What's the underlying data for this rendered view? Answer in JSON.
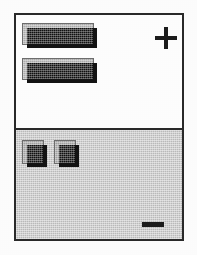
{
  "figure": {
    "kind": "technical-line-drawing",
    "background_color": "#ffffff",
    "frame": {
      "border_color": "#2a2a2a",
      "fill_color": "#ffffff",
      "x": 14,
      "y": 13,
      "width": 170,
      "height": 228
    },
    "regions": [
      {
        "id": "upper",
        "name": "upper-white-region",
        "fill_color": "#fefefe",
        "shading": "none",
        "height": 113
      },
      {
        "id": "lower",
        "name": "lower-shaded-region",
        "fill_color": "#c9c9c9",
        "shading": "dithered-halftone",
        "height": 109
      }
    ],
    "divider": {
      "name": "region-divider-line",
      "color": "#2a2a2a",
      "thickness": 2,
      "y": 113
    },
    "blocks": [
      {
        "id": "bar-top",
        "name": "wide-bar-top",
        "shape": "rectangle",
        "face_color": "#b9b9b9",
        "shadow_color": "#141414",
        "outline_color": "#6d6d6d",
        "region": "upper",
        "x": 6,
        "y": 8,
        "width": 72,
        "height": 22
      },
      {
        "id": "bar-bottom",
        "name": "wide-bar-bottom",
        "shape": "rectangle",
        "face_color": "#b9b9b9",
        "shadow_color": "#141414",
        "outline_color": "#6d6d6d",
        "region": "upper",
        "x": 6,
        "y": 43,
        "width": 72,
        "height": 22
      },
      {
        "id": "tile-left",
        "name": "small-square-left",
        "shape": "square",
        "face_color": "#aeaeae",
        "shadow_color": "#141414",
        "outline_color": "#6d6d6d",
        "region": "lower",
        "x": 6,
        "y": 10,
        "width": 22,
        "height": 24
      },
      {
        "id": "tile-right",
        "name": "small-square-right",
        "shape": "square",
        "face_color": "#aeaeae",
        "shadow_color": "#141414",
        "outline_color": "#6d6d6d",
        "region": "lower",
        "x": 38,
        "y": 10,
        "width": 22,
        "height": 24
      }
    ],
    "symbols": [
      {
        "id": "plus",
        "name": "plus-sign",
        "glyph": "+",
        "color": "#1d1d1d",
        "region": "upper",
        "position": "top-right",
        "x": 139,
        "y": 12,
        "size": 22
      },
      {
        "id": "minus",
        "name": "minus-sign",
        "glyph": "−",
        "color": "#1d1d1d",
        "region": "lower",
        "position": "bottom-right",
        "x": 126,
        "y": 92,
        "size": 22
      }
    ],
    "caption": ""
  }
}
